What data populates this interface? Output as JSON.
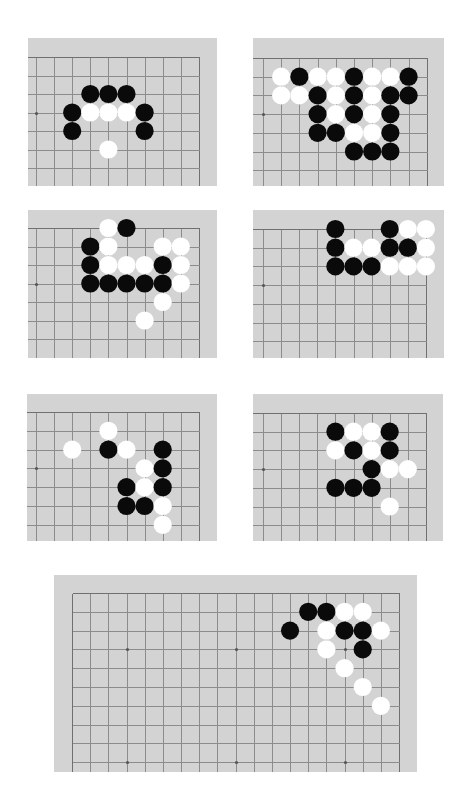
{
  "page": {
    "background": "#ffffff",
    "board_color": "#d3d3d3",
    "line_color": "#8c8c8c",
    "black_stone_color": "#0a0a0a",
    "white_stone_color": "#ffffff"
  },
  "diagrams": [
    {
      "id": "diagram-1",
      "panel": {
        "x": 28,
        "y": 38,
        "w": 189,
        "h": 148
      },
      "grid": {
        "x0": 8,
        "y0": 19,
        "dx": 18.1,
        "dy": 18.5,
        "cols": 10,
        "rows": 8
      },
      "edges": {
        "top": true,
        "right": true,
        "left": false,
        "bottom": false
      },
      "star_points": [
        [
          0,
          3
        ]
      ],
      "stones": [
        {
          "c": 3,
          "r": 2,
          "color": "black"
        },
        {
          "c": 4,
          "r": 2,
          "color": "black"
        },
        {
          "c": 5,
          "r": 2,
          "color": "black"
        },
        {
          "c": 2,
          "r": 3,
          "color": "black"
        },
        {
          "c": 3,
          "r": 3,
          "color": "white"
        },
        {
          "c": 4,
          "r": 3,
          "color": "white"
        },
        {
          "c": 5,
          "r": 3,
          "color": "white"
        },
        {
          "c": 6,
          "r": 3,
          "color": "black"
        },
        {
          "c": 2,
          "r": 4,
          "color": "black"
        },
        {
          "c": 6,
          "r": 4,
          "color": "black"
        },
        {
          "c": 4,
          "r": 5,
          "color": "white"
        }
      ]
    },
    {
      "id": "diagram-2",
      "panel": {
        "x": 253,
        "y": 38,
        "w": 191,
        "h": 148
      },
      "grid": {
        "x0": 10,
        "y0": 20,
        "dx": 18.2,
        "dy": 18.7,
        "cols": 10,
        "rows": 8
      },
      "edges": {
        "top": true,
        "right": true,
        "left": false,
        "bottom": false
      },
      "star_points": [
        [
          0,
          3
        ]
      ],
      "stones": [
        {
          "c": 1,
          "r": 1,
          "color": "white"
        },
        {
          "c": 2,
          "r": 1,
          "color": "black"
        },
        {
          "c": 3,
          "r": 1,
          "color": "white"
        },
        {
          "c": 4,
          "r": 1,
          "color": "white"
        },
        {
          "c": 5,
          "r": 1,
          "color": "black"
        },
        {
          "c": 6,
          "r": 1,
          "color": "white"
        },
        {
          "c": 7,
          "r": 1,
          "color": "white"
        },
        {
          "c": 8,
          "r": 1,
          "color": "black"
        },
        {
          "c": 1,
          "r": 2,
          "color": "white"
        },
        {
          "c": 2,
          "r": 2,
          "color": "white"
        },
        {
          "c": 3,
          "r": 2,
          "color": "black"
        },
        {
          "c": 4,
          "r": 2,
          "color": "white"
        },
        {
          "c": 5,
          "r": 2,
          "color": "black"
        },
        {
          "c": 6,
          "r": 2,
          "color": "white"
        },
        {
          "c": 7,
          "r": 2,
          "color": "black"
        },
        {
          "c": 8,
          "r": 2,
          "color": "black"
        },
        {
          "c": 3,
          "r": 3,
          "color": "black"
        },
        {
          "c": 4,
          "r": 3,
          "color": "white"
        },
        {
          "c": 5,
          "r": 3,
          "color": "black"
        },
        {
          "c": 6,
          "r": 3,
          "color": "white"
        },
        {
          "c": 7,
          "r": 3,
          "color": "black"
        },
        {
          "c": 3,
          "r": 4,
          "color": "black"
        },
        {
          "c": 4,
          "r": 4,
          "color": "black"
        },
        {
          "c": 5,
          "r": 4,
          "color": "white"
        },
        {
          "c": 6,
          "r": 4,
          "color": "white"
        },
        {
          "c": 7,
          "r": 4,
          "color": "black"
        },
        {
          "c": 5,
          "r": 5,
          "color": "black"
        },
        {
          "c": 6,
          "r": 5,
          "color": "black"
        },
        {
          "c": 7,
          "r": 5,
          "color": "black"
        }
      ]
    },
    {
      "id": "diagram-3",
      "panel": {
        "x": 28,
        "y": 210,
        "w": 189,
        "h": 148
      },
      "grid": {
        "x0": 8,
        "y0": 18,
        "dx": 18.1,
        "dy": 18.5,
        "cols": 10,
        "rows": 8
      },
      "edges": {
        "top": true,
        "right": true,
        "left": false,
        "bottom": false
      },
      "star_points": [
        [
          0,
          3
        ]
      ],
      "stones": [
        {
          "c": 4,
          "r": 0,
          "color": "white"
        },
        {
          "c": 5,
          "r": 0,
          "color": "black"
        },
        {
          "c": 3,
          "r": 1,
          "color": "black"
        },
        {
          "c": 4,
          "r": 1,
          "color": "white"
        },
        {
          "c": 7,
          "r": 1,
          "color": "white"
        },
        {
          "c": 8,
          "r": 1,
          "color": "white"
        },
        {
          "c": 3,
          "r": 2,
          "color": "black"
        },
        {
          "c": 4,
          "r": 2,
          "color": "white"
        },
        {
          "c": 5,
          "r": 2,
          "color": "white"
        },
        {
          "c": 6,
          "r": 2,
          "color": "white"
        },
        {
          "c": 7,
          "r": 2,
          "color": "black"
        },
        {
          "c": 8,
          "r": 2,
          "color": "white"
        },
        {
          "c": 3,
          "r": 3,
          "color": "black"
        },
        {
          "c": 4,
          "r": 3,
          "color": "black"
        },
        {
          "c": 5,
          "r": 3,
          "color": "black"
        },
        {
          "c": 6,
          "r": 3,
          "color": "black"
        },
        {
          "c": 7,
          "r": 3,
          "color": "black"
        },
        {
          "c": 8,
          "r": 3,
          "color": "white"
        },
        {
          "c": 7,
          "r": 4,
          "color": "white"
        },
        {
          "c": 6,
          "r": 5,
          "color": "white"
        }
      ]
    },
    {
      "id": "diagram-4",
      "panel": {
        "x": 253,
        "y": 210,
        "w": 191,
        "h": 148
      },
      "grid": {
        "x0": 10,
        "y0": 19,
        "dx": 18.1,
        "dy": 18.7,
        "cols": 10,
        "rows": 8
      },
      "edges": {
        "top": true,
        "right": true,
        "left": false,
        "bottom": false
      },
      "star_points": [
        [
          0,
          3
        ]
      ],
      "stones": [
        {
          "c": 4,
          "r": 0,
          "color": "black"
        },
        {
          "c": 7,
          "r": 0,
          "color": "black"
        },
        {
          "c": 8,
          "r": 0,
          "color": "white"
        },
        {
          "c": 9,
          "r": 0,
          "color": "white"
        },
        {
          "c": 4,
          "r": 1,
          "color": "black"
        },
        {
          "c": 5,
          "r": 1,
          "color": "white"
        },
        {
          "c": 6,
          "r": 1,
          "color": "white"
        },
        {
          "c": 7,
          "r": 1,
          "color": "black"
        },
        {
          "c": 8,
          "r": 1,
          "color": "black"
        },
        {
          "c": 9,
          "r": 1,
          "color": "white"
        },
        {
          "c": 4,
          "r": 2,
          "color": "black"
        },
        {
          "c": 5,
          "r": 2,
          "color": "black"
        },
        {
          "c": 6,
          "r": 2,
          "color": "black"
        },
        {
          "c": 7,
          "r": 2,
          "color": "white"
        },
        {
          "c": 8,
          "r": 2,
          "color": "white"
        },
        {
          "c": 9,
          "r": 2,
          "color": "white"
        }
      ]
    },
    {
      "id": "diagram-5",
      "panel": {
        "x": 27,
        "y": 394,
        "w": 190,
        "h": 147
      },
      "grid": {
        "x0": 9,
        "y0": 18,
        "dx": 18.1,
        "dy": 18.8,
        "cols": 10,
        "rows": 8
      },
      "edges": {
        "top": true,
        "right": true,
        "left": false,
        "bottom": false
      },
      "star_points": [
        [
          0,
          3
        ]
      ],
      "stones": [
        {
          "c": 4,
          "r": 1,
          "color": "white"
        },
        {
          "c": 2,
          "r": 2,
          "color": "white"
        },
        {
          "c": 4,
          "r": 2,
          "color": "black"
        },
        {
          "c": 5,
          "r": 2,
          "color": "white"
        },
        {
          "c": 7,
          "r": 2,
          "color": "black"
        },
        {
          "c": 6,
          "r": 3,
          "color": "white"
        },
        {
          "c": 7,
          "r": 3,
          "color": "black"
        },
        {
          "c": 5,
          "r": 4,
          "color": "black"
        },
        {
          "c": 6,
          "r": 4,
          "color": "white"
        },
        {
          "c": 7,
          "r": 4,
          "color": "black"
        },
        {
          "c": 5,
          "r": 5,
          "color": "black"
        },
        {
          "c": 6,
          "r": 5,
          "color": "black"
        },
        {
          "c": 7,
          "r": 5,
          "color": "white"
        },
        {
          "c": 7,
          "r": 6,
          "color": "white"
        }
      ]
    },
    {
      "id": "diagram-6",
      "panel": {
        "x": 253,
        "y": 394,
        "w": 190,
        "h": 147
      },
      "grid": {
        "x0": 10,
        "y0": 19,
        "dx": 18.1,
        "dy": 18.7,
        "cols": 10,
        "rows": 8
      },
      "edges": {
        "top": true,
        "right": true,
        "left": false,
        "bottom": false
      },
      "star_points": [
        [
          0,
          3
        ]
      ],
      "stones": [
        {
          "c": 4,
          "r": 1,
          "color": "black"
        },
        {
          "c": 5,
          "r": 1,
          "color": "white"
        },
        {
          "c": 6,
          "r": 1,
          "color": "white"
        },
        {
          "c": 7,
          "r": 1,
          "color": "black"
        },
        {
          "c": 4,
          "r": 2,
          "color": "white"
        },
        {
          "c": 5,
          "r": 2,
          "color": "black"
        },
        {
          "c": 6,
          "r": 2,
          "color": "white"
        },
        {
          "c": 7,
          "r": 2,
          "color": "black"
        },
        {
          "c": 6,
          "r": 3,
          "color": "black"
        },
        {
          "c": 7,
          "r": 3,
          "color": "white"
        },
        {
          "c": 8,
          "r": 3,
          "color": "white"
        },
        {
          "c": 4,
          "r": 4,
          "color": "black"
        },
        {
          "c": 5,
          "r": 4,
          "color": "black"
        },
        {
          "c": 6,
          "r": 4,
          "color": "black"
        },
        {
          "c": 7,
          "r": 5,
          "color": "white"
        }
      ]
    },
    {
      "id": "diagram-7",
      "panel": {
        "x": 54,
        "y": 575,
        "w": 363,
        "h": 197
      },
      "grid": {
        "x0": 18,
        "y0": 18,
        "dx": 18.17,
        "dy": 18.8,
        "cols": 19,
        "rows": 11
      },
      "edges": {
        "top": true,
        "right": true,
        "left": true,
        "bottom": false
      },
      "star_points": [
        [
          3,
          3
        ],
        [
          9,
          3
        ],
        [
          15,
          3
        ],
        [
          3,
          9
        ],
        [
          9,
          9
        ],
        [
          15,
          9
        ]
      ],
      "stones": [
        {
          "c": 13,
          "r": 1,
          "color": "black"
        },
        {
          "c": 14,
          "r": 1,
          "color": "black"
        },
        {
          "c": 15,
          "r": 1,
          "color": "white"
        },
        {
          "c": 16,
          "r": 1,
          "color": "white"
        },
        {
          "c": 12,
          "r": 2,
          "color": "black"
        },
        {
          "c": 14,
          "r": 2,
          "color": "white"
        },
        {
          "c": 15,
          "r": 2,
          "color": "black"
        },
        {
          "c": 16,
          "r": 2,
          "color": "black"
        },
        {
          "c": 17,
          "r": 2,
          "color": "white"
        },
        {
          "c": 14,
          "r": 3,
          "color": "white"
        },
        {
          "c": 16,
          "r": 3,
          "color": "black"
        },
        {
          "c": 15,
          "r": 4,
          "color": "white"
        },
        {
          "c": 16,
          "r": 5,
          "color": "white"
        },
        {
          "c": 17,
          "r": 6,
          "color": "white"
        }
      ]
    }
  ]
}
